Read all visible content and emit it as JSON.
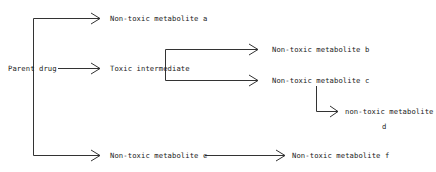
{
  "diagram": {
    "title": "",
    "nodes": {
      "parent": {
        "label": "Parent drug"
      },
      "a": {
        "label": "Non-toxic metabolite a"
      },
      "toxic": {
        "label": "Toxic intermediate"
      },
      "b": {
        "label": "Non-toxic metabolite b"
      },
      "c": {
        "label": "Non-toxic metabolite c"
      },
      "d_line1": {
        "label": "non-toxic metabolite"
      },
      "d_line2": {
        "label": "d"
      },
      "e": {
        "label": "Non-toxic metabolite e"
      },
      "f": {
        "label": "Non-toxic metabolite f"
      }
    },
    "edges": [
      {
        "from": "Parent drug",
        "to": "Non-toxic metabolite a"
      },
      {
        "from": "Parent drug",
        "to": "Toxic intermediate"
      },
      {
        "from": "Parent drug",
        "to": "Non-toxic metabolite e"
      },
      {
        "from": "Toxic intermediate",
        "to": "Non-toxic metabolite b"
      },
      {
        "from": "Toxic intermediate",
        "to": "Non-toxic metabolite c"
      },
      {
        "from": "Non-toxic metabolite c",
        "to": "non-toxic metabolite d"
      },
      {
        "from": "Non-toxic metabolite e",
        "to": "Non-toxic metabolite f"
      }
    ],
    "colors": {
      "line": "#333333",
      "text": "#222222",
      "background": "#ffffff"
    }
  }
}
